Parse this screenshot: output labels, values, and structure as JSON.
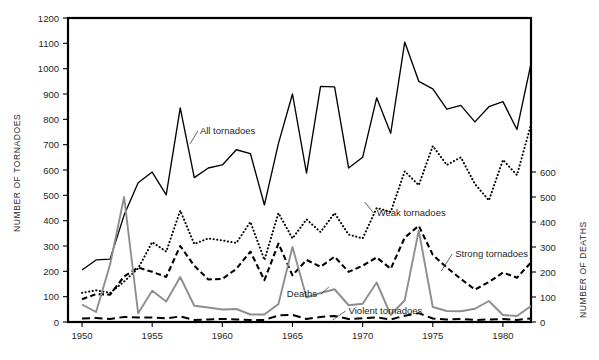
{
  "chart_data": {
    "type": "line",
    "title": "",
    "xlabel": "",
    "ylabel": "NUMBER OF TORNADOES",
    "y2label": "NUMBER OF DEATHS",
    "grid": false,
    "legend_position": "inline-annotations",
    "xlim": [
      1949,
      1982
    ],
    "ylim": [
      0,
      1200
    ],
    "y2lim": [
      0,
      600
    ],
    "xticks": [
      1950,
      1955,
      1960,
      1965,
      1970,
      1975,
      1980
    ],
    "xticklabels": [
      "1950",
      "1955",
      "1960",
      "1965",
      "1970",
      "1975",
      "1980"
    ],
    "yticks": [
      0,
      100,
      200,
      300,
      400,
      500,
      600,
      700,
      800,
      900,
      1000,
      1100,
      1200
    ],
    "yticklabels": [
      "0",
      "100",
      "200",
      "300",
      "400",
      "500",
      "600",
      "700",
      "800",
      "900",
      "1000",
      "1100",
      "1200"
    ],
    "y2ticks": [
      0,
      100,
      200,
      300,
      400,
      500,
      600
    ],
    "y2ticklabels": [
      "0",
      "100",
      "200",
      "300",
      "400",
      "500",
      "600"
    ],
    "x": [
      1950,
      1951,
      1952,
      1953,
      1954,
      1955,
      1956,
      1957,
      1958,
      1959,
      1960,
      1961,
      1962,
      1963,
      1964,
      1965,
      1966,
      1967,
      1968,
      1969,
      1970,
      1971,
      1972,
      1973,
      1974,
      1975,
      1976,
      1977,
      1978,
      1979,
      1980,
      1981,
      1982
    ],
    "series": [
      {
        "name": "All tornadoes",
        "axis": "left",
        "style": "solid",
        "color": "#000000",
        "values": [
          205,
          245,
          248,
          422,
          550,
          592,
          502,
          845,
          570,
          608,
          620,
          680,
          665,
          462,
          705,
          900,
          588,
          930,
          928,
          608,
          650,
          885,
          745,
          1105,
          950,
          920,
          840,
          855,
          790,
          850,
          870,
          760,
          1020
        ]
      },
      {
        "name": "Weak tornadoes",
        "axis": "left",
        "style": "dotted",
        "color": "#000000",
        "values": [
          115,
          125,
          115,
          160,
          212,
          315,
          278,
          440,
          308,
          330,
          322,
          312,
          395,
          245,
          430,
          330,
          405,
          355,
          430,
          345,
          330,
          450,
          435,
          595,
          540,
          695,
          620,
          650,
          545,
          480,
          640,
          580,
          780
        ]
      },
      {
        "name": "Strong tornadoes",
        "axis": "left",
        "style": "dashed",
        "color": "#000000",
        "values": [
          90,
          110,
          108,
          180,
          215,
          198,
          178,
          300,
          222,
          168,
          170,
          210,
          278,
          165,
          310,
          184,
          245,
          218,
          258,
          198,
          222,
          255,
          210,
          333,
          380,
          265,
          215,
          170,
          128,
          158,
          195,
          175,
          235
        ]
      },
      {
        "name": "Violent tornadoes",
        "axis": "left",
        "style": "long-dashed",
        "color": "#000000",
        "values": [
          14,
          16,
          12,
          20,
          18,
          18,
          14,
          22,
          8,
          10,
          12,
          10,
          8,
          8,
          26,
          28,
          12,
          20,
          24,
          12,
          15,
          18,
          10,
          25,
          35,
          14,
          10,
          12,
          8,
          10,
          12,
          8,
          14
        ]
      },
      {
        "name": "Deaths",
        "axis": "right",
        "style": "solid-gray",
        "color": "#8e8e8e",
        "values": [
          70,
          40,
          230,
          500,
          35,
          125,
          82,
          180,
          65,
          58,
          50,
          52,
          30,
          30,
          72,
          300,
          98,
          116,
          131,
          67,
          73,
          158,
          28,
          87,
          366,
          60,
          44,
          43,
          53,
          84,
          28,
          24,
          64
        ]
      }
    ],
    "annotations": [
      {
        "id": "all-tornadoes",
        "label": "All tornadoes",
        "x": 1958.4,
        "y_px": 134
      },
      {
        "id": "weak-tornadoes",
        "label": "Weak tornadoes",
        "x": 1971.0,
        "y_px": 216
      },
      {
        "id": "strong-tornadoes",
        "label": "Strong tornadoes",
        "x": 1976.6,
        "y_px": 257
      },
      {
        "id": "deaths",
        "label": "Deaths",
        "x": 1964.6,
        "y_px": 297
      },
      {
        "id": "violent-tornadoes",
        "label": "Violent tornadoes",
        "x": 1969.0,
        "y_px": 314
      }
    ]
  }
}
